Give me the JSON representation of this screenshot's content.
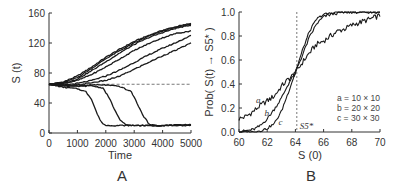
{
  "figure": {
    "panels": [
      "A",
      "B"
    ]
  },
  "chart_data": [
    {
      "type": "line",
      "panel_label": "A",
      "title": "",
      "xlabel": "Time",
      "ylabel": "S (t)",
      "xlim": [
        0,
        5000
      ],
      "ylim": [
        0,
        160
      ],
      "xticks": [
        0,
        1000,
        2000,
        3000,
        4000,
        5000
      ],
      "xtick_labels": [
        "0",
        "1000",
        "2000",
        "3000",
        "4000",
        "5000"
      ],
      "yticks": [
        0,
        40,
        80,
        120,
        160
      ],
      "ytick_labels": [
        "0",
        "40",
        "80",
        "120",
        "160"
      ],
      "grid": false,
      "reference_line": {
        "type": "horizontal",
        "style": "dashed",
        "y": 65,
        "x_from": 1500,
        "x_to": 5000
      },
      "series": [
        {
          "name": "run-1 (up)",
          "x": [
            0,
            500,
            1000,
            1500,
            2000,
            2500,
            3000,
            3500,
            4000,
            4500,
            5000
          ],
          "values": [
            65,
            68,
            76,
            88,
            101,
            112,
            122,
            130,
            137,
            142,
            146
          ]
        },
        {
          "name": "run-2 (up)",
          "x": [
            0,
            500,
            1000,
            1500,
            2000,
            2500,
            3000,
            3500,
            4000,
            4500,
            5000
          ],
          "values": [
            65,
            67,
            74,
            86,
            99,
            110,
            120,
            129,
            136,
            141,
            145
          ]
        },
        {
          "name": "run-3 (up)",
          "x": [
            0,
            500,
            1000,
            1500,
            2000,
            2500,
            3000,
            3500,
            4000,
            4500,
            5000
          ],
          "values": [
            65,
            66,
            72,
            83,
            95,
            107,
            118,
            127,
            134,
            140,
            144
          ]
        },
        {
          "name": "run-4 (up)",
          "x": [
            0,
            500,
            1000,
            1500,
            2000,
            2500,
            3000,
            3500,
            4000,
            4500,
            5000
          ],
          "values": [
            65,
            66,
            70,
            78,
            88,
            99,
            110,
            119,
            127,
            133,
            136
          ]
        },
        {
          "name": "run-5 (up)",
          "x": [
            0,
            500,
            1000,
            1500,
            2000,
            2500,
            3000,
            3500,
            4000,
            4500,
            5000
          ],
          "values": [
            65,
            64,
            66,
            70,
            76,
            84,
            94,
            104,
            113,
            121,
            130
          ]
        },
        {
          "name": "run-6 (up)",
          "x": [
            0,
            500,
            1000,
            1500,
            2000,
            2500,
            3000,
            3500,
            4000,
            4500,
            5000
          ],
          "values": [
            65,
            63,
            64,
            67,
            70,
            76,
            85,
            94,
            103,
            111,
            120
          ]
        },
        {
          "name": "run-7 (down)",
          "x": [
            0,
            500,
            1000,
            1300,
            1500,
            1700,
            1850,
            2000,
            2500,
            3000,
            4000,
            5000
          ],
          "values": [
            65,
            61,
            59,
            55,
            45,
            25,
            14,
            10,
            10,
            10,
            10,
            11
          ]
        },
        {
          "name": "run-8 (down)",
          "x": [
            0,
            500,
            1000,
            1500,
            1900,
            2100,
            2300,
            2500,
            2700,
            3000,
            4000,
            5000
          ],
          "values": [
            65,
            63,
            62,
            63,
            60,
            48,
            32,
            17,
            11,
            10,
            10,
            11
          ]
        },
        {
          "name": "run-9 (down)",
          "x": [
            0,
            500,
            1000,
            1500,
            2000,
            2500,
            2900,
            3100,
            3300,
            3500,
            3700,
            4000,
            5000
          ],
          "values": [
            65,
            64,
            63,
            64,
            64,
            62,
            55,
            40,
            24,
            13,
            10,
            10,
            10
          ]
        }
      ]
    },
    {
      "type": "line",
      "panel_label": "B",
      "title": "",
      "xlabel": "S (0)",
      "ylabel": "Prob( S(t) → S5* )",
      "xlim": [
        60,
        70
      ],
      "ylim": [
        0,
        1.0
      ],
      "xticks": [
        60,
        62,
        64,
        66,
        68,
        70
      ],
      "xtick_labels": [
        "60",
        "62",
        "64",
        "66",
        "68",
        "70"
      ],
      "yticks": [
        0.0,
        0.2,
        0.4,
        0.6,
        0.8,
        1.0
      ],
      "ytick_labels": [
        "0.0",
        "0.2",
        "0.4",
        "0.6",
        "0.8",
        "1.0"
      ],
      "grid": false,
      "reference_line": {
        "type": "vertical",
        "style": "dashed",
        "x": 64.1,
        "label": "S5*"
      },
      "legend": {
        "position": "lower right",
        "entries": [
          "a = 10 × 10",
          "b = 20 × 20",
          "c = 30 × 30"
        ]
      },
      "series": [
        {
          "name": "a",
          "label": "a = 10 × 10",
          "x": [
            60,
            60.5,
            61,
            61.5,
            62,
            62.5,
            63,
            63.5,
            64,
            64.5,
            65,
            65.5,
            66,
            66.5,
            67,
            67.5,
            68,
            68.5,
            69,
            69.5,
            70
          ],
          "values": [
            0.11,
            0.13,
            0.17,
            0.22,
            0.26,
            0.3,
            0.38,
            0.44,
            0.49,
            0.58,
            0.66,
            0.73,
            0.76,
            0.8,
            0.84,
            0.86,
            0.89,
            0.91,
            0.93,
            0.95,
            0.97
          ]
        },
        {
          "name": "b",
          "label": "b = 20 × 20",
          "x": [
            60,
            60.5,
            61,
            61.5,
            62,
            62.5,
            63,
            63.5,
            64,
            64.5,
            65,
            65.5,
            66,
            66.5,
            67,
            67.5,
            68,
            68.5,
            69,
            69.5,
            70
          ],
          "values": [
            0.0,
            0.01,
            0.02,
            0.05,
            0.11,
            0.19,
            0.28,
            0.4,
            0.5,
            0.64,
            0.79,
            0.9,
            0.96,
            0.98,
            0.99,
            1.0,
            1.0,
            1.0,
            1.0,
            1.0,
            1.0
          ]
        },
        {
          "name": "c",
          "label": "c = 30 × 30",
          "x": [
            60,
            60.5,
            61,
            61.5,
            62,
            62.5,
            63,
            63.5,
            64,
            64.5,
            65,
            65.5,
            66,
            66.5,
            67,
            67.5,
            68,
            68.5,
            69,
            69.5,
            70
          ],
          "values": [
            0.0,
            0.0,
            0.0,
            0.01,
            0.03,
            0.07,
            0.17,
            0.33,
            0.5,
            0.68,
            0.84,
            0.94,
            0.98,
            0.99,
            1.0,
            1.0,
            1.0,
            1.0,
            1.0,
            1.0,
            1.0
          ]
        }
      ],
      "curve_labels": [
        {
          "text": "a",
          "x": 61.2,
          "y": 0.24
        },
        {
          "text": "b",
          "x": 61.8,
          "y": 0.13
        },
        {
          "text": "c",
          "x": 62.8,
          "y": 0.06
        }
      ]
    }
  ]
}
